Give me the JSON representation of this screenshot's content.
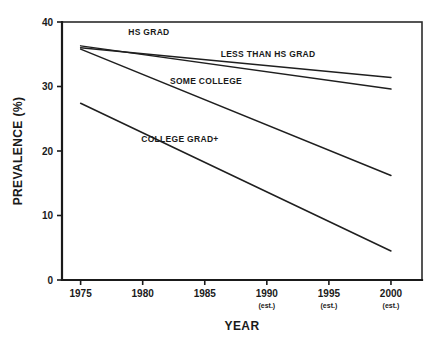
{
  "chart_data": {
    "type": "line",
    "title": "",
    "xlabel": "YEAR",
    "ylabel": "PREVALENCE (%)",
    "xlim": [
      1973.5,
      2002.5
    ],
    "ylim": [
      0,
      40
    ],
    "grid": false,
    "legend_position": "inline-labels",
    "x": [
      1975,
      2000
    ],
    "xticks": [
      {
        "value": 1975,
        "label": "1975",
        "note": ""
      },
      {
        "value": 1980,
        "label": "1980",
        "note": ""
      },
      {
        "value": 1985,
        "label": "1985",
        "note": ""
      },
      {
        "value": 1990,
        "label": "1990",
        "note": "(est.)"
      },
      {
        "value": 1995,
        "label": "1995",
        "note": "(est.)"
      },
      {
        "value": 2000,
        "label": "2000",
        "note": "(est.)"
      }
    ],
    "yticks": [
      {
        "value": 0,
        "label": "0"
      },
      {
        "value": 10,
        "label": "10"
      },
      {
        "value": 20,
        "label": "20"
      },
      {
        "value": 30,
        "label": "30"
      },
      {
        "value": 40,
        "label": "40"
      }
    ],
    "series": [
      {
        "name": "LESS THAN HS GRAD",
        "label": "LESS THAN HS GRAD",
        "x": [
          1975,
          2000
        ],
        "values": [
          36.0,
          31.4
        ],
        "label_x": 1990.1,
        "label_y": 34.6,
        "label_anchor": "middle"
      },
      {
        "name": "HS GRAD",
        "label": "HS GRAD",
        "x": [
          1975,
          2000
        ],
        "values": [
          36.3,
          29.6
        ],
        "label_x": 1980.5,
        "label_y": 38.0,
        "label_anchor": "middle"
      },
      {
        "name": "SOME COLLEGE",
        "label": "SOME COLLEGE",
        "x": [
          1975,
          2000
        ],
        "values": [
          35.8,
          16.2
        ],
        "label_x": 1985.1,
        "label_y": 30.4,
        "label_anchor": "middle"
      },
      {
        "name": "COLLEGE GRAD+",
        "label": "COLLEGE GRAD+",
        "x": [
          1975,
          2000
        ],
        "values": [
          27.4,
          4.5
        ],
        "label_x": 1983.0,
        "label_y": 21.4,
        "label_anchor": "middle"
      }
    ]
  }
}
